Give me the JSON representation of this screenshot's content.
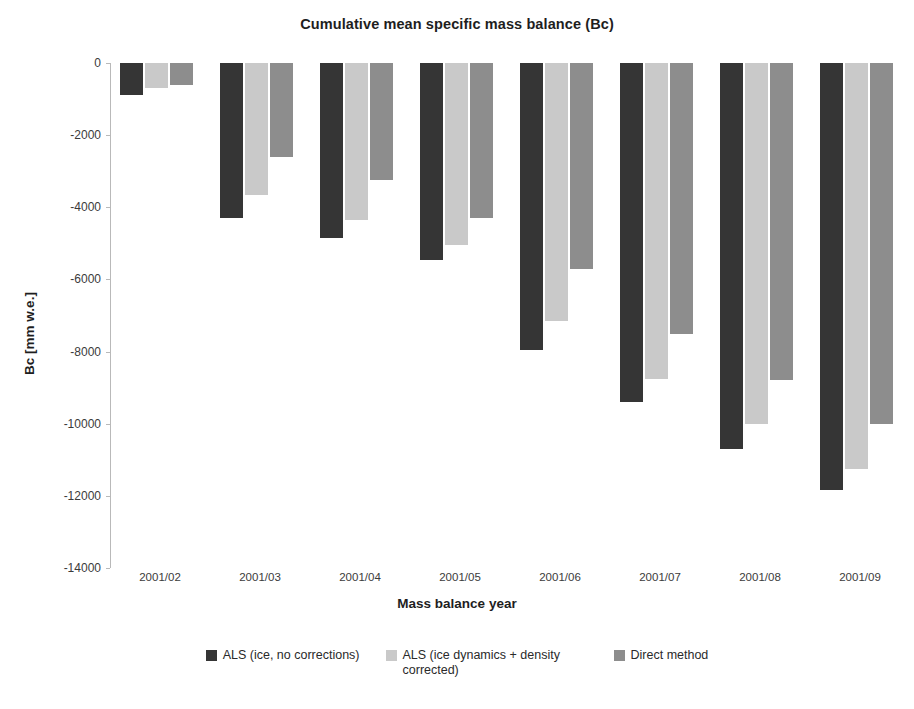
{
  "chart_data": {
    "type": "bar",
    "title": "Cumulative mean specific mass balance (Bc)",
    "xlabel": "Mass balance year",
    "ylabel": "Bc [mm w.e.]",
    "categories": [
      "2001/02",
      "2001/03",
      "2001/04",
      "2001/05",
      "2001/06",
      "2001/07",
      "2001/08",
      "2001/09"
    ],
    "series": [
      {
        "name": "ALS (ice, no corrections)",
        "color": "#353535",
        "values": [
          -900,
          -4300,
          -4850,
          -5450,
          -7950,
          -9400,
          -10700,
          -11850
        ]
      },
      {
        "name": "ALS (ice dynamics + density corrected)",
        "color": "#c9c9c9",
        "values": [
          -700,
          -3650,
          -4350,
          -5050,
          -7150,
          -8750,
          -10000,
          -11250
        ]
      },
      {
        "name": "Direct method",
        "color": "#8d8d8d",
        "values": [
          -600,
          -2600,
          -3250,
          -4300,
          -5700,
          -7500,
          -8800,
          -10000
        ]
      }
    ],
    "ylim": [
      -14000,
      0
    ],
    "yticks": [
      0,
      -2000,
      -4000,
      -6000,
      -8000,
      -10000,
      -12000,
      -14000
    ],
    "ytick_labels": [
      "0",
      "-2000",
      "-4000",
      "-6000",
      "-8000",
      "-10000",
      "-12000",
      "-14000"
    ],
    "grid": false,
    "legend_position": "bottom"
  }
}
